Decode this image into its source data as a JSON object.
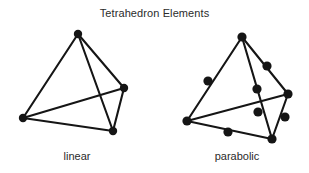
{
  "figure": {
    "title": "Tetrahedron Elements",
    "background_color": "#ffffff",
    "ink_color": "#151515",
    "captions": {
      "left": "linear",
      "right": "parabolic"
    }
  },
  "chart_data": {
    "type": "diagram",
    "title": "Tetrahedron Elements",
    "subtitle": "",
    "xlabel": "",
    "ylabel": "",
    "elements": [
      {
        "name": "linear",
        "label": "linear",
        "node_count": 4,
        "edge_count": 6,
        "node_radius": 4.2,
        "nodes": [
          {
            "id": "L1",
            "role": "corner",
            "x": 78,
            "y": 34
          },
          {
            "id": "L2",
            "role": "corner",
            "x": 124,
            "y": 88
          },
          {
            "id": "L3",
            "role": "corner",
            "x": 23,
            "y": 118
          },
          {
            "id": "L4",
            "role": "corner",
            "x": 113,
            "y": 131
          }
        ],
        "edges": [
          [
            "L1",
            "L2"
          ],
          [
            "L1",
            "L3"
          ],
          [
            "L1",
            "L4"
          ],
          [
            "L2",
            "L4"
          ],
          [
            "L3",
            "L4"
          ],
          [
            "L3",
            "L2"
          ]
        ],
        "hidden_edges": [
          [
            "L3",
            "L2"
          ]
        ]
      },
      {
        "name": "parabolic",
        "label": "parabolic",
        "node_count": 10,
        "edge_count": 6,
        "node_radius": 4.6,
        "nodes": [
          {
            "id": "P1",
            "role": "corner",
            "x": 242,
            "y": 37
          },
          {
            "id": "P2",
            "role": "corner",
            "x": 288,
            "y": 94
          },
          {
            "id": "P3",
            "role": "corner",
            "x": 187,
            "y": 121
          },
          {
            "id": "P4",
            "role": "corner",
            "x": 272,
            "y": 139
          },
          {
            "id": "P5",
            "role": "midside",
            "x": 267,
            "y": 66
          },
          {
            "id": "P6",
            "role": "midside",
            "x": 208,
            "y": 81
          },
          {
            "id": "P7",
            "role": "midside",
            "x": 257,
            "y": 89
          },
          {
            "id": "P8",
            "role": "midside",
            "x": 285,
            "y": 117
          },
          {
            "id": "P9",
            "role": "midside",
            "x": 228,
            "y": 132
          },
          {
            "id": "P10",
            "role": "midside",
            "x": 258,
            "y": 112
          }
        ],
        "edges": [
          [
            "P1",
            "P5",
            "P2"
          ],
          [
            "P1",
            "P6",
            "P3"
          ],
          [
            "P1",
            "P7",
            "P4"
          ],
          [
            "P2",
            "P8",
            "P4"
          ],
          [
            "P3",
            "P9",
            "P4"
          ],
          [
            "P3",
            "P10",
            "P2"
          ]
        ],
        "hidden_edges": [
          [
            "P3",
            "P10",
            "P2"
          ]
        ]
      }
    ],
    "annotations": [
      {
        "text": "linear",
        "x": 77,
        "y": 158
      },
      {
        "text": "parabolic",
        "x": 237,
        "y": 158
      }
    ]
  }
}
